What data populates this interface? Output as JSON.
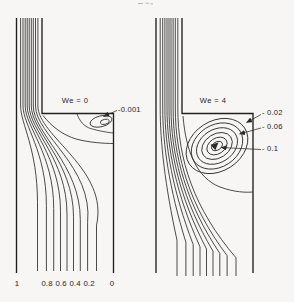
{
  "figure": {
    "background": "#f7f6f4",
    "line_color": "#2e2b28",
    "wall_color": "#211f1c",
    "text_color": "#262421"
  },
  "panels": [
    {
      "id": "we0",
      "title": "We = 0",
      "title_anchor": {
        "x": 75,
        "y": 101
      },
      "contour_labels": [
        {
          "text": "-0.001",
          "value": -0.001,
          "x": 118,
          "y": 110,
          "arrow": {
            "x1": 117,
            "y1": 110.5,
            "x2": 103.5,
            "y2": 116.5
          }
        }
      ],
      "ticks": [
        {
          "label": "1",
          "x": 17
        },
        {
          "label": "0.8",
          "x": 47
        },
        {
          "label": "0.6",
          "x": 61
        },
        {
          "label": "0.4",
          "x": 75
        },
        {
          "label": "0.2",
          "x": 89
        },
        {
          "label": "0",
          "x": 112
        }
      ],
      "ticks_y": 284
    },
    {
      "id": "we4",
      "title": "We = 4",
      "title_anchor": {
        "x": 213,
        "y": 101
      },
      "contour_labels": [
        {
          "text": "- 0.02",
          "value": -0.02,
          "x": 262,
          "y": 113,
          "arrow": {
            "x1": 261,
            "y1": 114.5,
            "x2": 246.5,
            "y2": 122.5
          }
        },
        {
          "text": "- 0.06",
          "value": -0.06,
          "x": 262,
          "y": 126.5,
          "arrow": {
            "x1": 261,
            "y1": 128,
            "x2": 239.5,
            "y2": 134
          }
        },
        {
          "text": "- 0.1",
          "value": -0.1,
          "x": 262,
          "y": 149,
          "arrow": {
            "x1": 261,
            "y1": 149.5,
            "x2": 221,
            "y2": 147.5
          }
        }
      ],
      "ticks": [],
      "ticks_y": null
    }
  ],
  "chart_data": {
    "type": "line",
    "subtype": "streamline_contour_plot",
    "grid": false,
    "legend_position": "none",
    "flow_geometry": {
      "contraction_ratio": "4:1",
      "left_wall_stream_function": 1,
      "right_wall_stream_function": 0
    },
    "panels": [
      {
        "title": "We = 0",
        "We": 0,
        "streamline_values": [
          0.9,
          0.8,
          0.7,
          0.6,
          0.5,
          0.4,
          0.3,
          0.2,
          0.1
        ],
        "inlet_tick_labels": [
          "1",
          "0.8",
          "0.6",
          "0.4",
          "0.2",
          "0"
        ],
        "vortex_contour_values": [
          -0.001
        ],
        "vortex_note": "small corner vortex"
      },
      {
        "title": "We = 4",
        "We": 4,
        "streamline_values": [
          0.9,
          0.8,
          0.7,
          0.6,
          0.5,
          0.4,
          0.3,
          0.2,
          0.1
        ],
        "inlet_tick_labels": [],
        "vortex_contour_values": [
          -0.02,
          -0.06,
          -0.1
        ],
        "vortex_note": "large corner vortex with nested closed contours"
      }
    ]
  }
}
